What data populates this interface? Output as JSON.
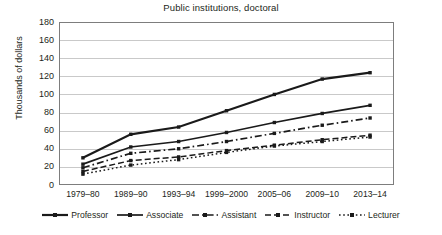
{
  "chart_data": {
    "type": "line",
    "title": "Public institutions, doctoral",
    "xlabel": "",
    "ylabel": "Thousands of dollars",
    "categories": [
      "1979–80",
      "1989–90",
      "1993–94",
      "1999–2000",
      "2005–06",
      "2009–10",
      "2013–14"
    ],
    "ylim": [
      0,
      180
    ],
    "yticks": [
      0,
      20,
      40,
      60,
      80,
      100,
      120,
      140,
      160,
      180
    ],
    "grid": true,
    "legend_position": "bottom",
    "series": [
      {
        "name": "Professor",
        "values": [
          30,
          56,
          64,
          82,
          100,
          117,
          124
        ],
        "style": "solid",
        "color": "#1a1a1a",
        "width": 2.2,
        "marker": "square"
      },
      {
        "name": "Associate",
        "values": [
          23,
          42,
          48,
          58,
          69,
          79,
          88
        ],
        "style": "solid",
        "color": "#1a1a1a",
        "width": 1.7,
        "marker": "square"
      },
      {
        "name": "Assistant",
        "values": [
          19,
          35,
          40,
          48,
          57,
          66,
          74
        ],
        "style": "dashdot",
        "color": "#1a1a1a",
        "width": 1.7,
        "marker": "square"
      },
      {
        "name": "Instructor",
        "values": [
          15,
          27,
          31,
          38,
          44,
          50,
          55
        ],
        "style": "dashed",
        "color": "#1a1a1a",
        "width": 1.5,
        "marker": "square"
      },
      {
        "name": "Lecturer",
        "values": [
          12,
          22,
          28,
          36,
          43,
          48,
          53
        ],
        "style": "dotted",
        "color": "#1a1a1a",
        "width": 1.5,
        "marker": "square"
      }
    ]
  },
  "legend": {
    "items": [
      {
        "label": "Professor"
      },
      {
        "label": "Associate"
      },
      {
        "label": "Assistant"
      },
      {
        "label": "Instructor"
      },
      {
        "label": "Lecturer"
      }
    ]
  },
  "axis": {
    "y_tick_labels": [
      "180",
      "160",
      "140",
      "120",
      "100",
      "80",
      "60",
      "40",
      "20",
      "0"
    ],
    "y_axis_title": "Thousands of dollars"
  }
}
